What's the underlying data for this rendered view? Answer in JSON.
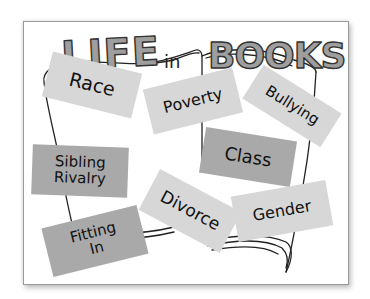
{
  "title": {
    "word1": "LIFE",
    "word2": "in",
    "word3": "BOOKS",
    "letter_fill": "#9e9e9e",
    "outline": "#333333"
  },
  "illustration": "open-book",
  "notes": [
    {
      "id": "race",
      "label": "Race",
      "shade": "light"
    },
    {
      "id": "poverty",
      "label": "Poverty",
      "shade": "light"
    },
    {
      "id": "bullying",
      "label": "Bullying",
      "shade": "light"
    },
    {
      "id": "sibling-rivalry",
      "label_line1": "Sibling",
      "label_line2": "Rivalry",
      "shade": "dark"
    },
    {
      "id": "class",
      "label": "Class",
      "shade": "dark"
    },
    {
      "id": "divorce",
      "label": "Divorce",
      "shade": "light"
    },
    {
      "id": "gender",
      "label": "Gender",
      "shade": "light"
    },
    {
      "id": "fitting-in",
      "label_line1": "Fitting",
      "label_line2": "In",
      "shade": "dark"
    }
  ],
  "colors": {
    "light_note": "#d7d7d7",
    "dark_note": "#a9a9a9",
    "ink": "#111111",
    "frame_border": "#9a9a9a"
  }
}
